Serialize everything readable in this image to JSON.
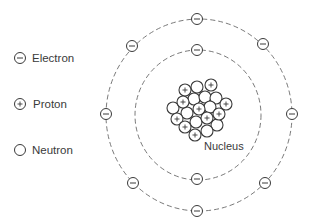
{
  "diagram": {
    "type": "atom-model",
    "legend": [
      {
        "key": "electron",
        "symbol": "minus",
        "label": "Electron"
      },
      {
        "key": "proton",
        "symbol": "plus",
        "label": "Proton"
      },
      {
        "key": "neutron",
        "symbol": "empty",
        "label": "Neutron"
      }
    ],
    "nucleus_label": "Nucleus",
    "orbits": [
      {
        "name": "inner-shell",
        "cx": 198,
        "cy": 115,
        "rx": 63,
        "ry": 65,
        "electron_count": 2
      },
      {
        "name": "outer-shell",
        "cx": 199,
        "cy": 115,
        "rx": 93,
        "ry": 96,
        "electron_count": 8
      }
    ],
    "electrons": [
      {
        "shell": "inner",
        "x": 197,
        "y": 50
      },
      {
        "shell": "inner",
        "x": 197,
        "y": 179
      },
      {
        "shell": "outer",
        "x": 197,
        "y": 19
      },
      {
        "shell": "outer",
        "x": 132,
        "y": 46
      },
      {
        "shell": "outer",
        "x": 263,
        "y": 44
      },
      {
        "shell": "outer",
        "x": 106,
        "y": 114
      },
      {
        "shell": "outer",
        "x": 292,
        "y": 114
      },
      {
        "shell": "outer",
        "x": 133,
        "y": 183
      },
      {
        "shell": "outer",
        "x": 265,
        "y": 183
      },
      {
        "shell": "outer",
        "x": 197,
        "y": 211
      }
    ],
    "nucleus": {
      "proton_count": 10,
      "neutron_count": 10,
      "particles": [
        {
          "type": "neutron",
          "x": 197,
          "y": 87
        },
        {
          "type": "neutron",
          "x": 194,
          "y": 99
        },
        {
          "type": "neutron",
          "x": 205,
          "y": 97
        },
        {
          "type": "neutron",
          "x": 216,
          "y": 98
        },
        {
          "type": "neutron",
          "x": 173,
          "y": 108
        },
        {
          "type": "neutron",
          "x": 187,
          "y": 113
        },
        {
          "type": "neutron",
          "x": 210,
          "y": 107
        },
        {
          "type": "neutron",
          "x": 196,
          "y": 122
        },
        {
          "type": "neutron",
          "x": 217,
          "y": 125
        },
        {
          "type": "neutron",
          "x": 207,
          "y": 131
        },
        {
          "type": "proton",
          "x": 185,
          "y": 90
        },
        {
          "type": "proton",
          "x": 211,
          "y": 85
        },
        {
          "type": "proton",
          "x": 183,
          "y": 102
        },
        {
          "type": "proton",
          "x": 226,
          "y": 104
        },
        {
          "type": "proton",
          "x": 199,
          "y": 109
        },
        {
          "type": "proton",
          "x": 219,
          "y": 114
        },
        {
          "type": "proton",
          "x": 177,
          "y": 119
        },
        {
          "type": "proton",
          "x": 207,
          "y": 118
        },
        {
          "type": "proton",
          "x": 185,
          "y": 127
        },
        {
          "type": "proton",
          "x": 195,
          "y": 135
        }
      ]
    },
    "colors": {
      "stroke": "#3a3a3a",
      "orbit": "#6a6a6a",
      "background": "#ffffff"
    }
  }
}
